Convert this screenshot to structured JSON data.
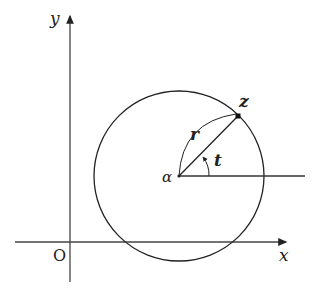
{
  "diagram": {
    "axes": {
      "x_label": "x",
      "y_label": "y",
      "origin_label": "O"
    },
    "labels": {
      "center": "α",
      "point": "z",
      "radius": "r",
      "angle": "t"
    },
    "colors": {
      "stroke": "#222222",
      "background": "#ffffff"
    }
  }
}
